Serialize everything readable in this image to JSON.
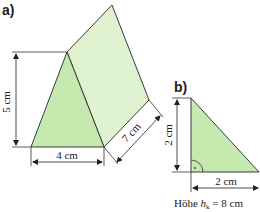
{
  "figure_a": {
    "label": "a)",
    "height_label": "5 cm",
    "base_label": "4 cm",
    "length_label": "7 cm",
    "colors": {
      "front_face": "#c6e9b0",
      "side_face": "#dff3d0",
      "edge": "#3a3a3a"
    }
  },
  "figure_b": {
    "label": "b)",
    "height_label": "2 cm",
    "base_label": "2 cm",
    "caption_prefix": "Höhe ",
    "caption_var": "h",
    "caption_sub": "k",
    "caption_suffix": " = 8 cm",
    "colors": {
      "fill": "#c6e9b0",
      "edge": "#3a3a3a"
    }
  }
}
